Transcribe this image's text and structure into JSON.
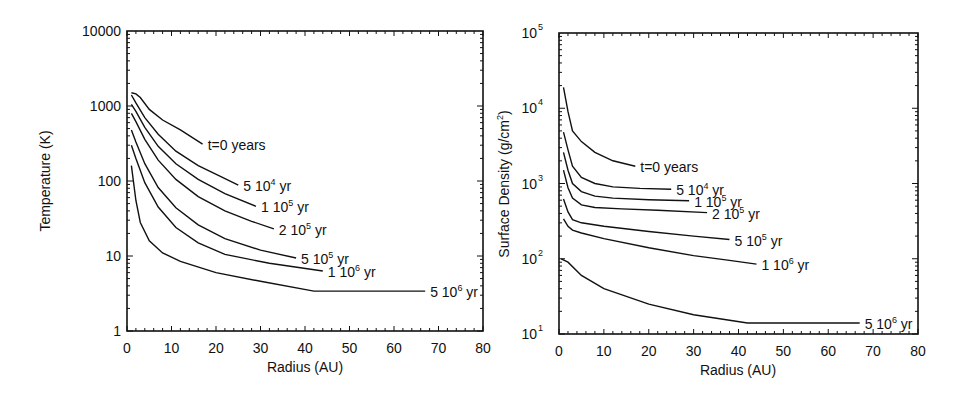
{
  "chart_data": [
    {
      "type": "line",
      "title": "",
      "xlabel": "Radius (AU)",
      "ylabel": "Temperature (K)",
      "xscale": "linear",
      "yscale": "log",
      "xlim": [
        0,
        80
      ],
      "ylim": [
        1,
        10000
      ],
      "x_ticks": [
        "0",
        "10",
        "20",
        "30",
        "40",
        "50",
        "60",
        "70",
        "80"
      ],
      "y_ticks": [
        "1",
        "10",
        "100",
        "1000",
        "10000"
      ],
      "grid": false,
      "legend": "inline labels at curve ends",
      "series": [
        {
          "name": "t=0 years",
          "label_parts": [
            "t=0 years",
            "",
            ""
          ],
          "x": [
            1,
            2,
            3,
            5,
            8,
            12,
            17
          ],
          "y": [
            1500,
            1450,
            1300,
            900,
            650,
            480,
            310
          ]
        },
        {
          "name": "5 10^4 yr",
          "label_parts": [
            "5 10",
            "4",
            " yr"
          ],
          "x": [
            1,
            2,
            4,
            7,
            11,
            16,
            21,
            25
          ],
          "y": [
            1400,
            1100,
            700,
            420,
            250,
            160,
            115,
            88
          ]
        },
        {
          "name": "1 10^5 yr",
          "label_parts": [
            "1 10",
            "5",
            " yr"
          ],
          "x": [
            1,
            2,
            4,
            7,
            11,
            16,
            22,
            29
          ],
          "y": [
            1050,
            850,
            520,
            290,
            170,
            105,
            68,
            46
          ]
        },
        {
          "name": "2 10^5 yr",
          "label_parts": [
            "2 10",
            "5",
            " yr"
          ],
          "x": [
            1,
            2,
            4,
            7,
            11,
            16,
            22,
            28,
            33
          ],
          "y": [
            800,
            620,
            360,
            190,
            105,
            62,
            40,
            29,
            23
          ]
        },
        {
          "name": "5 10^5 yr",
          "label_parts": [
            "5 10",
            "5",
            " yr"
          ],
          "x": [
            1,
            2,
            4,
            7,
            11,
            16,
            22,
            30,
            38
          ],
          "y": [
            480,
            330,
            170,
            82,
            44,
            26,
            17,
            12,
            9.4
          ]
        },
        {
          "name": "1 10^6 yr",
          "label_parts": [
            "1 10",
            "6",
            " yr"
          ],
          "x": [
            1,
            2,
            4,
            7,
            11,
            16,
            22,
            32,
            44
          ],
          "y": [
            300,
            200,
            95,
            45,
            24,
            15,
            10.5,
            8,
            6.3
          ]
        },
        {
          "name": "5 10^6 yr",
          "label_parts": [
            "5 10",
            "6",
            " yr"
          ],
          "x": [
            1,
            2,
            3,
            5,
            8,
            12,
            20,
            30,
            42,
            50,
            60,
            67
          ],
          "y": [
            160,
            55,
            28,
            16,
            11,
            8.5,
            6,
            4.6,
            3.4,
            3.4,
            3.4,
            3.4
          ]
        }
      ]
    },
    {
      "type": "line",
      "title": "",
      "xlabel": "Radius (AU)",
      "ylabel": "Surface Density (g/cm^2)",
      "xscale": "linear",
      "yscale": "log",
      "xlim": [
        0,
        80
      ],
      "ylim": [
        10,
        100000
      ],
      "x_ticks": [
        "0",
        "10",
        "20",
        "30",
        "40",
        "50",
        "60",
        "70",
        "80"
      ],
      "y_ticks": [
        "10^1",
        "10^2",
        "10^3",
        "10^4",
        "10^5"
      ],
      "grid": false,
      "legend": "inline labels at curve ends",
      "series": [
        {
          "name": "t=0 years",
          "label_parts": [
            "t=0 years",
            "",
            ""
          ],
          "x": [
            1,
            2,
            3,
            5,
            8,
            12,
            17
          ],
          "y": [
            19000,
            9000,
            5000,
            3600,
            2600,
            2000,
            1700
          ]
        },
        {
          "name": "5 10^4 yr",
          "label_parts": [
            "5 10",
            "4",
            " yr"
          ],
          "x": [
            1,
            2,
            3,
            5,
            8,
            12,
            18,
            25
          ],
          "y": [
            4800,
            2800,
            1700,
            1200,
            1000,
            900,
            860,
            840
          ]
        },
        {
          "name": "1 10^5 yr",
          "label_parts": [
            "1 10",
            "5",
            " yr"
          ],
          "x": [
            1,
            2,
            3,
            5,
            8,
            12,
            20,
            29
          ],
          "y": [
            2600,
            1500,
            1000,
            780,
            680,
            640,
            610,
            590
          ]
        },
        {
          "name": "2 10^5 yr",
          "label_parts": [
            "2 10",
            "5",
            " yr"
          ],
          "x": [
            1,
            2,
            3,
            5,
            8,
            14,
            22,
            33
          ],
          "y": [
            1500,
            880,
            640,
            520,
            480,
            460,
            440,
            410
          ]
        },
        {
          "name": "5 10^5 yr",
          "label_parts": [
            "5 10",
            "5",
            " yr"
          ],
          "x": [
            1,
            2,
            3,
            5,
            10,
            20,
            30,
            38
          ],
          "y": [
            620,
            420,
            330,
            300,
            270,
            230,
            200,
            180
          ]
        },
        {
          "name": "1 10^6 yr",
          "label_parts": [
            "1 10",
            "6",
            " yr"
          ],
          "x": [
            1,
            2,
            3,
            5,
            10,
            20,
            30,
            38,
            44
          ],
          "y": [
            340,
            270,
            240,
            220,
            185,
            140,
            110,
            95,
            85
          ]
        },
        {
          "name": "5 10^6 yr",
          "label_parts": [
            "5 10",
            "6",
            " yr"
          ],
          "x": [
            0.5,
            2,
            5,
            10,
            20,
            30,
            42,
            50,
            60,
            67
          ],
          "y": [
            100,
            90,
            60,
            40,
            25,
            18,
            14,
            14,
            14,
            14
          ]
        }
      ]
    }
  ],
  "charts": {
    "left": {
      "xlabel": "Radius (AU)",
      "ylabel": "Temperature (K)",
      "x_ticks": [
        "0",
        "10",
        "20",
        "30",
        "40",
        "50",
        "60",
        "70",
        "80"
      ],
      "y_ticks": [
        "1",
        "10",
        "100",
        "1000",
        "10000"
      ]
    },
    "right": {
      "xlabel": "Radius (AU)",
      "ylabel_main": "Surface Density (g/cm",
      "ylabel_sup": "2",
      "ylabel_end": ")",
      "x_ticks": [
        "0",
        "10",
        "20",
        "30",
        "40",
        "50",
        "60",
        "70",
        "80"
      ],
      "y_ticks_base": [
        "10",
        "10",
        "10",
        "10",
        "10"
      ],
      "y_ticks_exp": [
        "1",
        "2",
        "3",
        "4",
        "5"
      ]
    }
  }
}
